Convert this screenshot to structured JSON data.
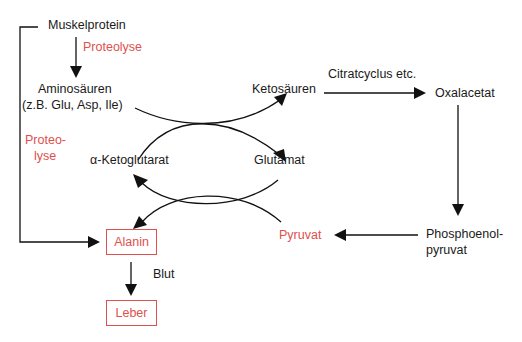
{
  "diagram": {
    "type": "metabolic-pathway",
    "nodes": {
      "muskelprotein": "Muskelprotein",
      "aminosaeuren_line1": "Aminosäuren",
      "aminosaeuren_line2": "(z.B. Glu, Asp, Ile)",
      "ketosaeuren": "Ketosäuren",
      "oxalacetat": "Oxalacetat",
      "alpha_ketoglutarat": "α-Ketoglutarat",
      "glutamat": "Glutamat",
      "alanin": "Alanin",
      "pyruvat": "Pyruvat",
      "pep_line1": "Phosphoenol-",
      "pep_line2": "pyruvat",
      "leber": "Leber"
    },
    "edge_labels": {
      "proteolyse_top": "Proteolyse",
      "proteolyse_side_line1": "Proteo-",
      "proteolyse_side_line2": "lyse",
      "citratcyclus": "Citratcyclus etc.",
      "blut": "Blut"
    },
    "edges": [
      {
        "from": "Muskelprotein",
        "to": "Aminosäuren",
        "label": "Proteolyse"
      },
      {
        "from": "Muskelprotein",
        "to": "Alanin",
        "label": "Proteolyse"
      },
      {
        "from": "Aminosäuren",
        "to": "Ketosäuren"
      },
      {
        "from": "α-Ketoglutarat",
        "to": "Glutamat"
      },
      {
        "from": "Ketosäuren",
        "to": "Oxalacetat",
        "label": "Citratcyclus etc."
      },
      {
        "from": "Oxalacetat",
        "to": "Phosphoenolpyruvat"
      },
      {
        "from": "Phosphoenolpyruvat",
        "to": "Pyruvat"
      },
      {
        "from": "Glutamat",
        "to": "α-Ketoglutarat"
      },
      {
        "from": "Pyruvat",
        "to": "Alanin"
      },
      {
        "from": "Alanin",
        "to": "Leber",
        "label": "Blut"
      }
    ],
    "colors": {
      "highlight": "#e0504e",
      "text": "#1a1a1a",
      "line": "#111111"
    }
  }
}
